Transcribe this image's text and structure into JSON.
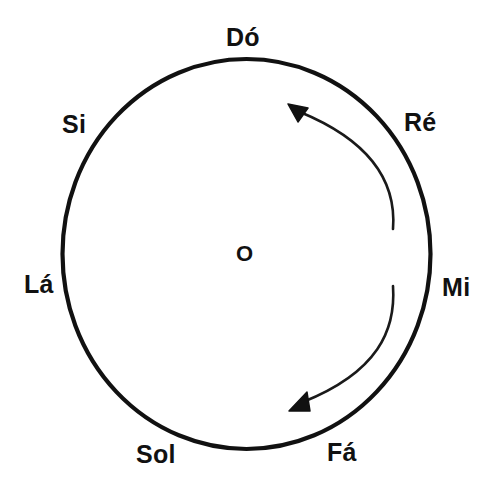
{
  "figure": {
    "title": "",
    "center_label": "O",
    "colors": {
      "stroke": "#111111",
      "background": "#ffffff"
    }
  },
  "notes": [
    {
      "label": "Dó",
      "position": "top",
      "angle_deg": 90
    },
    {
      "label": "Ré",
      "position": "upper-right",
      "angle_deg": 50
    },
    {
      "label": "Mi",
      "position": "right",
      "angle_deg": 0
    },
    {
      "label": "Fá",
      "position": "lower-right",
      "angle_deg": -50
    },
    {
      "label": "Sol",
      "position": "bottom",
      "angle_deg": -105
    },
    {
      "label": "Lá",
      "position": "left",
      "angle_deg": 180
    },
    {
      "label": "Si",
      "position": "upper-left",
      "angle_deg": 135
    }
  ],
  "arrows": [
    {
      "name": "upper-arc-arrow",
      "direction": "counter-clockwise",
      "head_at": "upper"
    },
    {
      "name": "lower-arc-arrow",
      "direction": "counter-clockwise",
      "head_at": "lower"
    }
  ]
}
